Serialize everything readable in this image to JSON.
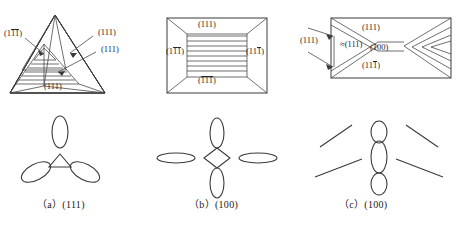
{
  "figure": {
    "panel_count": 3
  },
  "colors": {
    "stroke": "#3a3a3a",
    "text": "#1a1a1a",
    "background": "#ffffff"
  },
  "panels": [
    {
      "id": "a",
      "shape": "triangle",
      "caption": "（a）(111)",
      "caption_letter": "(a)",
      "caption_plane": "(111)",
      "labels": [
        {
          "name": "left-plane",
          "prefix": "(1",
          "over": "11",
          "suffix": ")"
        },
        {
          "name": "right-upper-plane",
          "text": "(111)"
        },
        {
          "name": "right-lower-plane",
          "text": "(111)"
        },
        {
          "name": "base-plane",
          "text": "(111)"
        }
      ],
      "pole_figure": {
        "symmetry": "3-fold",
        "center": "triangle",
        "lobes": 3
      }
    },
    {
      "id": "b",
      "shape": "nested-rectangle",
      "caption": "（b）(100)",
      "caption_letter": "(b)",
      "caption_plane": "(100)",
      "labels": [
        {
          "name": "top-plane",
          "text": "(111)"
        },
        {
          "name": "left-plane",
          "prefix": "(1",
          "over": "11",
          "suffix": ")"
        },
        {
          "name": "right-plane",
          "prefix": "(11",
          "over": "1",
          "suffix": ")"
        },
        {
          "name": "bottom-plane",
          "prefix": "(",
          "over": "111",
          "suffix": ")"
        }
      ],
      "pole_figure": {
        "symmetry": "4-fold",
        "center": "diamond",
        "lobes": 4
      }
    },
    {
      "id": "c",
      "shape": "rectangle-with-chevrons",
      "caption": "（c）(100)",
      "caption_letter": "(c)",
      "caption_plane": "(100)",
      "labels": [
        {
          "name": "outer-left-plane",
          "text": "(111)"
        },
        {
          "name": "approx-left-plane",
          "text": "≈(111)"
        },
        {
          "name": "top-plane",
          "text": "(111)"
        },
        {
          "name": "center-plane",
          "text": "(100)"
        },
        {
          "name": "bottom-plane",
          "prefix": "(11",
          "over": "1",
          "suffix": ")"
        }
      ],
      "pole_figure": {
        "symmetry": "2-fold",
        "center": "vertical-ellipse",
        "lobes": 3,
        "rays": 4
      }
    }
  ]
}
